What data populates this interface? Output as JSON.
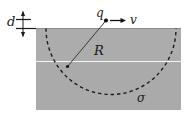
{
  "figure": {
    "kind": "physics-diagram",
    "labels": {
      "gap_label": "d",
      "charge_label": "q",
      "velocity_label": "v",
      "radius_label": "R",
      "surface_charge_label": "σ"
    },
    "colors": {
      "background": "#ffffff",
      "slab_fill": "#acacac",
      "slab_fill_alt": "#b2b2b2",
      "ink": "#1a1a1a",
      "dash_stroke": "#1c1c1c",
      "interface_line": "#f2f2f2"
    },
    "geometry": {
      "slab": {
        "x": 36,
        "y": 28,
        "width": 145,
        "height": 82
      },
      "charge_point": {
        "x": 106,
        "y": 20
      },
      "velocity_arrow": {
        "x1": 111,
        "y1": 20,
        "x2": 124,
        "y2": 20
      },
      "radius_line": {
        "x1": 106,
        "y1": 20,
        "x2": 67,
        "y2": 67
      },
      "arc": {
        "cx": 111,
        "cy": 29,
        "rx": 65,
        "ry": 66
      },
      "interface_line_y": 61,
      "dimension_line_x": 23,
      "dimension_top_y": 11,
      "dimension_bottom_y": 36
    }
  }
}
